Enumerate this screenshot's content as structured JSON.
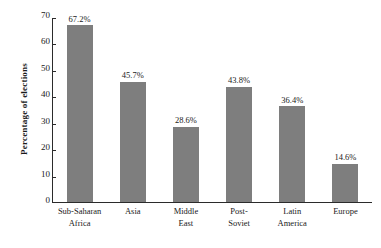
{
  "chart_data": {
    "type": "bar",
    "title": "",
    "xlabel": "",
    "ylabel": "Percentage of elections",
    "categories": [
      "Sub-Saharan Africa",
      "Asia",
      "Middle East",
      "Post-Soviet",
      "Latin America",
      "Europe"
    ],
    "category_lines": [
      [
        "Sub-Saharan",
        "Africa"
      ],
      [
        "Asia"
      ],
      [
        "Middle",
        "East"
      ],
      [
        "Post-",
        "Soviet"
      ],
      [
        "Latin",
        "America"
      ],
      [
        "Europe"
      ]
    ],
    "values": [
      67.2,
      45.7,
      28.6,
      43.8,
      36.4,
      14.6
    ],
    "value_labels": [
      "67.2%",
      "45.7%",
      "28.6%",
      "43.8%",
      "36.4%",
      "14.6%"
    ],
    "ylim": [
      0,
      70
    ],
    "ytick_values": [
      0,
      10,
      20,
      30,
      40,
      50,
      60,
      70
    ],
    "ytick_labels": [
      "0",
      "10",
      "20",
      "30",
      "40",
      "50",
      "60",
      "70"
    ],
    "grid": false,
    "legend": null,
    "bar_color": "#7e7e7e",
    "axis_color": "#2b2b2b",
    "background_color": "#ffffff"
  }
}
